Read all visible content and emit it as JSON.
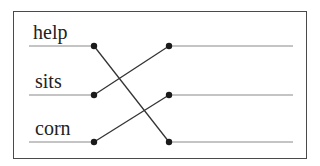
{
  "diagram": {
    "type": "matching-lines",
    "words": [
      {
        "label": "help",
        "y": 46
      },
      {
        "label": "sits",
        "y": 95
      },
      {
        "label": "corn",
        "y": 142
      }
    ],
    "right_slots": [
      {
        "y": 46
      },
      {
        "y": 95
      },
      {
        "y": 142
      }
    ],
    "connections": [
      {
        "from": 0,
        "to": 2
      },
      {
        "from": 1,
        "to": 0
      },
      {
        "from": 2,
        "to": 1
      }
    ],
    "colors": {
      "border": "#4a4a4a",
      "line": "#333333",
      "underline": "#8a8a8a",
      "dot": "#1a1a1a"
    }
  }
}
